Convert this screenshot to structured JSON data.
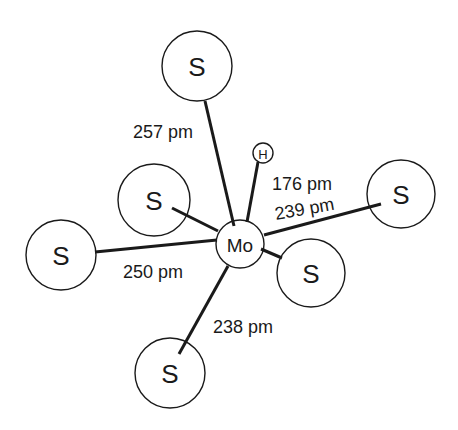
{
  "diagram": {
    "type": "molecular-structure",
    "central_atom": {
      "label": "Mo",
      "x": 240,
      "y": 244,
      "r": 24,
      "font_size": 19
    },
    "hydrogen": {
      "label": "H",
      "x": 263,
      "y": 153,
      "r": 10,
      "font_size": 13
    },
    "sulfur_atoms": [
      {
        "id": "s-top",
        "label": "S",
        "x": 197,
        "y": 66,
        "r": 35
      },
      {
        "id": "s-upper-left",
        "label": "S",
        "x": 154,
        "y": 200,
        "r": 36
      },
      {
        "id": "s-left",
        "label": "S",
        "x": 61,
        "y": 255,
        "r": 35
      },
      {
        "id": "s-bottom",
        "label": "S",
        "x": 170,
        "y": 373,
        "r": 35
      },
      {
        "id": "s-lower-right",
        "label": "S",
        "x": 311,
        "y": 273,
        "r": 34
      },
      {
        "id": "s-right",
        "label": "S",
        "x": 401,
        "y": 194,
        "r": 34
      }
    ],
    "bonds": [
      {
        "id": "bond-top",
        "x1": 205,
        "y1": 101,
        "x2": 234,
        "y2": 226
      },
      {
        "id": "bond-h",
        "x1": 258,
        "y1": 162,
        "x2": 247,
        "y2": 222
      },
      {
        "id": "bond-right",
        "x1": 264,
        "y1": 235,
        "x2": 381,
        "y2": 204
      },
      {
        "id": "bond-lower-right",
        "x1": 261,
        "y1": 249,
        "x2": 282,
        "y2": 258
      },
      {
        "id": "bond-upper-left",
        "x1": 172,
        "y1": 208,
        "x2": 218,
        "y2": 231
      },
      {
        "id": "bond-left",
        "x1": 95,
        "y1": 252,
        "x2": 217,
        "y2": 240
      },
      {
        "id": "bond-bottom",
        "x1": 228,
        "y1": 266,
        "x2": 179,
        "y2": 354
      }
    ],
    "bond_labels": [
      {
        "id": "label-257",
        "text": "257 pm",
        "x": 133,
        "y": 138,
        "rotate": 0
      },
      {
        "id": "label-176",
        "text": "176 pm",
        "x": 272,
        "y": 190,
        "rotate": 0
      },
      {
        "id": "label-239",
        "text": "239 pm",
        "x": 276,
        "y": 220,
        "rotate": -10
      },
      {
        "id": "label-250",
        "text": "250 pm",
        "x": 123,
        "y": 278,
        "rotate": 0
      },
      {
        "id": "label-238",
        "text": "238 pm",
        "x": 213,
        "y": 333,
        "rotate": 0
      }
    ],
    "colors": {
      "stroke": "#1a1a1a",
      "background": "#ffffff"
    }
  }
}
